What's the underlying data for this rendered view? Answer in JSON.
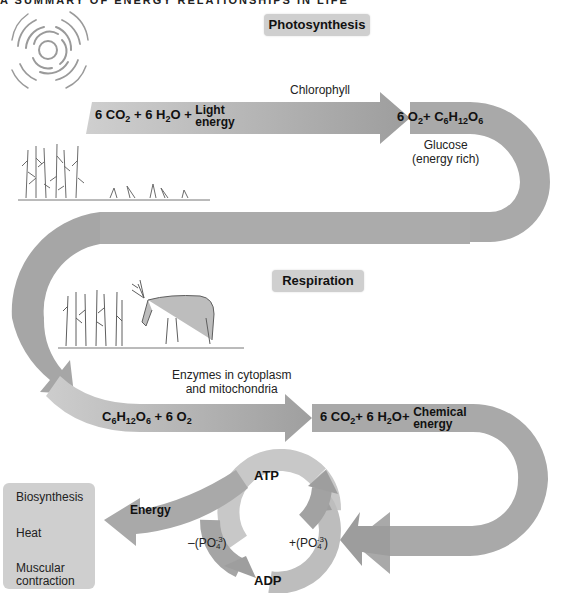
{
  "header": {
    "title": "A SUMMARY OF ENERGY RELATIONSHIPS IN LIFE"
  },
  "sections": {
    "photosynthesis": {
      "label": "Photosynthesis"
    },
    "respiration": {
      "label": "Respiration"
    }
  },
  "photosynthesis": {
    "catalyst": "Chlorophyll",
    "reactants": {
      "co2": "6 CO",
      "co2_sub": "2",
      "plus1": " + 6 H",
      "h2o_sub": "2",
      "o": "O + ",
      "energy_top": "Light",
      "energy_bottom": "energy"
    },
    "products": {
      "o2": "6 O",
      "o2_sub": "2",
      "plus": "+ C",
      "c_sub": "6",
      "h": "H",
      "h_sub": "12",
      "o": "O",
      "o_sub": "6"
    },
    "product_note": {
      "line1": "Glucose",
      "line2": "(energy rich)"
    }
  },
  "respiration": {
    "catalyst": {
      "line1": "Enzymes in  cytoplasm",
      "line2": "and mitochondria"
    },
    "reactants": {
      "c": "C",
      "c_sub": "6",
      "h": "H",
      "h_sub": "12",
      "o": "O",
      "o_sub": "6",
      "plus": " + 6 O",
      "o2_sub": "2"
    },
    "products": {
      "co2": "6 CO",
      "co2_sub": "2",
      "plus1": "+ 6 H",
      "h2o_sub": "2",
      "o": "O+",
      "energy_top": "Chemical",
      "energy_bottom": "energy"
    }
  },
  "atp_cycle": {
    "atp": "ATP",
    "adp": "ADP",
    "release": {
      "prefix": "–(PO",
      "sub": "4",
      "sup": "-3",
      "suffix": ")"
    },
    "bind": {
      "prefix": "+(PO",
      "sub": "4",
      "sup": "-3",
      "suffix": ")"
    },
    "energy_label": "Energy"
  },
  "energy_uses": [
    "Biosynthesis",
    "Heat",
    "Muscular",
    "contraction"
  ],
  "illustrations": {
    "sun": "sun-icon",
    "plants": "corn-plants-illustration",
    "deer": "grazing-deer-illustration"
  },
  "colors": {
    "band": "#a9a9a9",
    "band_light": "#c4c4c4",
    "tag": "#cfcfcf",
    "text": "#111111"
  }
}
